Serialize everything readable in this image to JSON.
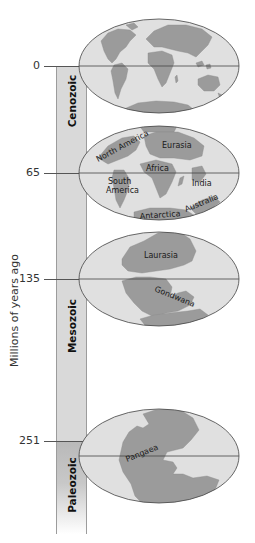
{
  "diagram": {
    "y_axis_label": "Millions of years ago",
    "colors": {
      "ocean": "#e0e0e0",
      "land": "#9b9b9b",
      "outline": "#444444",
      "timebar": "#d9d9d9",
      "timebar_paleozoic": "#b9b9b9"
    },
    "ticks": [
      {
        "label": "0",
        "y": 66
      },
      {
        "label": "65",
        "y": 173
      },
      {
        "label": "135",
        "y": 279
      },
      {
        "label": "251",
        "y": 441
      }
    ],
    "eras": [
      {
        "name": "Cenozoic",
        "from": 0,
        "to": 65
      },
      {
        "name": "Mesozoic",
        "from": 65,
        "to": 251
      },
      {
        "name": "Paleozoic",
        "from": 251,
        "to": null
      }
    ],
    "maps": [
      {
        "id": "present",
        "time_mya": "0",
        "labels": []
      },
      {
        "id": "65mya",
        "time_mya": "65",
        "labels": [
          "North America",
          "Eurasia",
          "Africa",
          "South America",
          "India",
          "Antarctica",
          "Australia"
        ]
      },
      {
        "id": "135mya",
        "time_mya": "135",
        "labels": [
          "Laurasia",
          "Gondwana"
        ]
      },
      {
        "id": "251mya",
        "time_mya": "251",
        "labels": [
          "Pangaea"
        ]
      }
    ]
  }
}
